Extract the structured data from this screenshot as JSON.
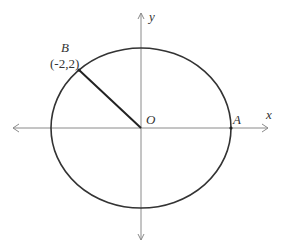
{
  "diagram": {
    "type": "ellipse-on-axes",
    "axes": {
      "x_label": "x",
      "y_label": "y"
    },
    "origin_label": "O",
    "points": [
      {
        "name": "B",
        "coords": "(-2,2)"
      },
      {
        "name": "A",
        "coords": ""
      }
    ],
    "colors": {
      "axis": "#8a8a8a",
      "curve": "#333333",
      "text": "#333333"
    }
  }
}
